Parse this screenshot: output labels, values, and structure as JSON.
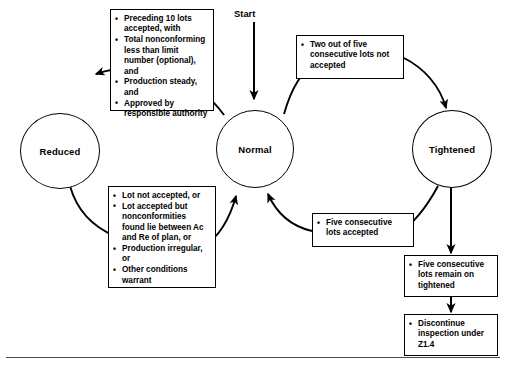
{
  "diagram": {
    "title_label": "Start",
    "states": [
      {
        "id": "reduced",
        "label": "Reduced"
      },
      {
        "id": "normal",
        "label": "Normal"
      },
      {
        "id": "tightened",
        "label": "Tightened"
      }
    ],
    "notes": [
      {
        "id": "normal-to-reduced-conditions",
        "items": [
          "Preceding 10 lots accepted, with",
          "Total nonconforming less than limit number (optional), and",
          "Production steady, and",
          "Approved by responsible authority"
        ]
      },
      {
        "id": "reduced-to-normal-conditions",
        "items": [
          "Lot not accepted, or",
          "Lot accepted but nonconformities found lie between Ac and Re of plan, or",
          "Production irregular, or",
          "Other conditions warrant"
        ]
      },
      {
        "id": "normal-to-tightened-conditions",
        "items": [
          "Two out of five consecutive lots not accepted"
        ]
      },
      {
        "id": "tightened-to-normal-conditions",
        "items": [
          "Five consecutive lots accepted"
        ]
      },
      {
        "id": "tightened-remain-conditions",
        "items": [
          "Five consecutive lots remain on tightened"
        ]
      },
      {
        "id": "discontinue-conditions",
        "items": [
          "Discontinue inspection under Z1.4"
        ]
      }
    ],
    "colors": {
      "stroke": "#000000",
      "background": "#ffffff",
      "rule": "#4a4a4a"
    }
  }
}
